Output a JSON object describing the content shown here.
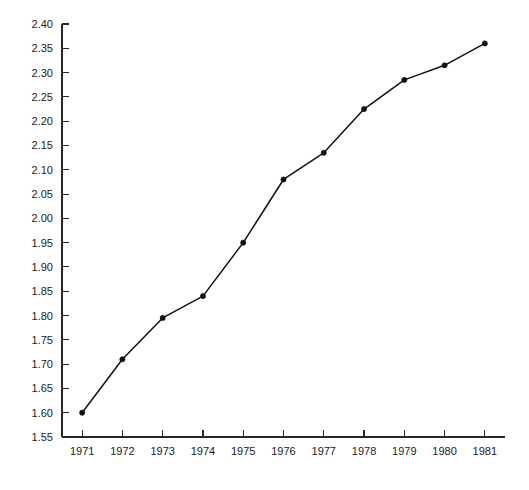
{
  "chart_data": {
    "type": "line",
    "title": "",
    "subtitle": "",
    "xlabel": "",
    "ylabel": "",
    "categories": [
      "1971",
      "1972",
      "1973",
      "1974",
      "1975",
      "1976",
      "1977",
      "1978",
      "1979",
      "1980",
      "1981"
    ],
    "x": [
      1971,
      1972,
      1973,
      1974,
      1975,
      1976,
      1977,
      1978,
      1979,
      1980,
      1981
    ],
    "values": [
      1.6,
      1.71,
      1.795,
      1.84,
      1.95,
      2.08,
      2.135,
      2.225,
      2.285,
      2.315,
      2.36
    ],
    "series": [
      {
        "name": "",
        "values": [
          1.6,
          1.71,
          1.795,
          1.84,
          1.95,
          2.08,
          2.135,
          2.225,
          2.285,
          2.315,
          2.36
        ],
        "color": "#111111",
        "marker": "circle",
        "line_style": "solid"
      }
    ],
    "ylim": [
      1.55,
      2.4
    ],
    "xlim": [
      1970.5,
      1981.5
    ],
    "ytick_labels": [
      "1.55",
      "1.60",
      "1.65",
      "1.70",
      "1.75",
      "1.80",
      "1.85",
      "1.90",
      "1.95",
      "2.00",
      "2.05",
      "2.10",
      "2.15",
      "2.20",
      "2.25",
      "2.30",
      "2.35",
      "2.40"
    ],
    "ytick_values": [
      1.55,
      1.6,
      1.65,
      1.7,
      1.75,
      1.8,
      1.85,
      1.9,
      1.95,
      2.0,
      2.05,
      2.1,
      2.15,
      2.2,
      2.25,
      2.3,
      2.35,
      2.4
    ],
    "ytick_step": 0.05,
    "xtick_labels": [
      "1971",
      "1972",
      "1973",
      "1974",
      "1975",
      "1976",
      "1977",
      "1978",
      "1979",
      "1980",
      "1981"
    ],
    "grid": false,
    "legend": false,
    "legend_position": "none",
    "annotations": [],
    "axis_style": "left-and-bottom-spines-only",
    "tick_direction": "inward",
    "background_color": "#ffffff",
    "axis_color": "#262626",
    "text_color": "#1a1a1a"
  },
  "figure": {
    "width": 529,
    "height": 490,
    "plot_left": 62,
    "plot_right": 505,
    "plot_top": 24,
    "plot_bottom": 437
  }
}
